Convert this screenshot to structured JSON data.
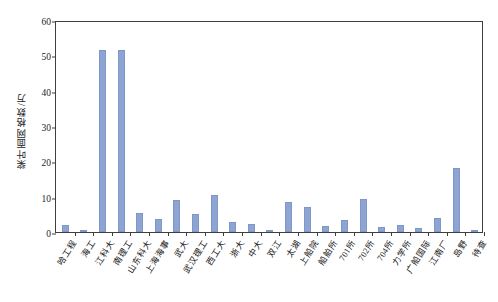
{
  "chart_data": {
    "type": "bar",
    "title": "",
    "xlabel": "",
    "ylabel": "桨叶面网格数/万",
    "ylim": [
      0,
      60
    ],
    "ytick_labels": [
      "0",
      "10",
      "20",
      "30",
      "40",
      "50",
      "60"
    ],
    "ytick_values": [
      0,
      10,
      20,
      30,
      40,
      50,
      60
    ],
    "grid": false,
    "legend": "none",
    "categories": [
      "哈工程",
      "海工",
      "江科大",
      "南理工",
      "山东科大",
      "上海海事",
      "武大",
      "武汉理工",
      "西工大",
      "浙大",
      "中大",
      "双江",
      "太湖",
      "上船院",
      "船舶所",
      "701所",
      "702所",
      "704所",
      "力学所",
      "广船国际",
      "江南厂",
      "岛野",
      "待查"
    ],
    "values": [
      2.0,
      0.4,
      51.5,
      51.6,
      5.5,
      3.6,
      9.2,
      5.0,
      10.5,
      2.9,
      2.3,
      0.6,
      8.5,
      7.1,
      1.7,
      3.5,
      9.3,
      1.5,
      1.9,
      1.2,
      4.0,
      18.0,
      0.2
    ],
    "series": [
      {
        "name": "桨叶面网格数",
        "values": [
          2.0,
          0.4,
          51.5,
          51.6,
          5.5,
          3.6,
          9.2,
          5.0,
          10.5,
          2.9,
          2.3,
          0.6,
          8.5,
          7.1,
          1.7,
          3.5,
          9.3,
          1.5,
          1.9,
          1.2,
          4.0,
          18.0,
          0.2
        ]
      }
    ],
    "colors": {
      "bar": "#8EA5D2",
      "bar_border": "#7E96C9",
      "axis": "#3F3F3F",
      "text": "#1A1A1A",
      "background": "#FFFFFF"
    }
  },
  "top_strip": {
    "faint_text": ""
  }
}
